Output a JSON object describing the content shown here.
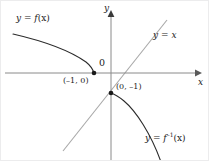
{
  "figure": {
    "type": "math-graph",
    "width": 209,
    "height": 161,
    "background_color": "#ffffff",
    "border_color": "#ececed"
  },
  "axes": {
    "color": "#8a8a8a",
    "x_label": "x",
    "y_label": "y",
    "origin_label": "0",
    "origin_px": {
      "x": 110,
      "y": 72
    },
    "x_axis_y_px": 72,
    "y_axis_x_px": 110,
    "x_arrow_tip_px": {
      "x": 198,
      "y": 72
    },
    "y_arrow_tip_px": {
      "x": 110,
      "y": 13
    }
  },
  "curves": [
    {
      "id": "identity-line",
      "label": "y = x",
      "label_text": "y =",
      "label_var": "x",
      "color": "#a8a8a8",
      "kind": "line",
      "path": "M 62 150 L 166 19"
    },
    {
      "id": "function-curve",
      "label": "y = f(x)",
      "label_lhs": "y = f",
      "label_rhs": "(x)",
      "color": "#2b2b2b",
      "kind": "curve",
      "path": "M 12 33 C 38 39, 68 49, 85 61 C 90 65, 92 69, 93 72"
    },
    {
      "id": "inverse-curve",
      "label": "y = f⁻¹(x)",
      "label_lhs": "y = f",
      "label_sup": "–1",
      "label_rhs": "(x)",
      "color": "#2b2b2b",
      "kind": "curve",
      "path": "M 110 92 C 113 93, 117 95, 123 100 C 135 110, 150 133, 160 161"
    }
  ],
  "points": [
    {
      "id": "point-neg1-0",
      "label": "(–1, 0)",
      "x_value": -1,
      "y_value": 0,
      "px": {
        "x": 93,
        "y": 72
      },
      "marker": "filled-dot",
      "color": "#1a1a1a"
    },
    {
      "id": "point-0-neg1",
      "label": "(0, –1)",
      "x_value": 0,
      "y_value": -1,
      "px": {
        "x": 110,
        "y": 92
      },
      "marker": "filled-dot",
      "color": "#1a1a1a"
    }
  ],
  "labels": {
    "y_axis": "y",
    "x_axis": "x",
    "origin": "0",
    "function": "y = f(x)",
    "identity": "y = x",
    "inverse": "y = f⁻¹(x)",
    "point_a": "(–1, 0)",
    "point_b": "(0, –1)"
  }
}
